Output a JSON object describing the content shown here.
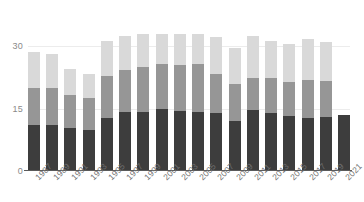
{
  "chart_data": {
    "type": "bar",
    "title": "",
    "subtitle": "",
    "xlabel": "",
    "ylabel": "",
    "stacked": true,
    "orientation": "vertical",
    "grid": true,
    "legend": "none",
    "ylim": [
      0,
      33
    ],
    "yticks": [
      0,
      15,
      30
    ],
    "ytick_labels": [
      "0",
      "15",
      "30"
    ],
    "categories": [
      "1987",
      "1989",
      "1991",
      "1993",
      "1995",
      "1997",
      "1999",
      "2001",
      "2003",
      "2005",
      "2007",
      "2009",
      "2011",
      "2013",
      "2015",
      "2017",
      "2019",
      "2021"
    ],
    "series": [
      {
        "name": "segment-dark",
        "color": "#3d3d3d",
        "values": [
          11.0,
          11.0,
          10.3,
          10.0,
          12.7,
          14.3,
          14.4,
          15.4,
          15.4,
          15.3,
          13.9,
          12.1,
          14.6,
          13.9,
          13.3,
          12.8,
          12.9,
          13.4
        ]
      },
      {
        "name": "segment-mid",
        "color": "#969696",
        "values": [
          8.9,
          9.0,
          7.9,
          7.6,
          10.2,
          10.1,
          10.9,
          11.5,
          11.5,
          12.3,
          9.5,
          8.8,
          7.9,
          8.4,
          8.1,
          9.1,
          8.8,
          0.0
        ]
      },
      {
        "name": "segment-light",
        "color": "#d9d9d9",
        "values": [
          8.7,
          8.3,
          6.4,
          5.7,
          8.3,
          8.1,
          8.1,
          7.4,
          8.0,
          7.7,
          8.8,
          8.8,
          10.0,
          9.0,
          9.2,
          10.0,
          9.4,
          0.0
        ]
      }
    ],
    "totals": [
      28.6,
      28.3,
      24.6,
      23.3,
      31.2,
      32.5,
      33.4,
      34.3,
      34.9,
      35.3,
      32.2,
      29.7,
      32.5,
      31.3,
      30.6,
      31.9,
      31.1,
      13.4
    ]
  }
}
